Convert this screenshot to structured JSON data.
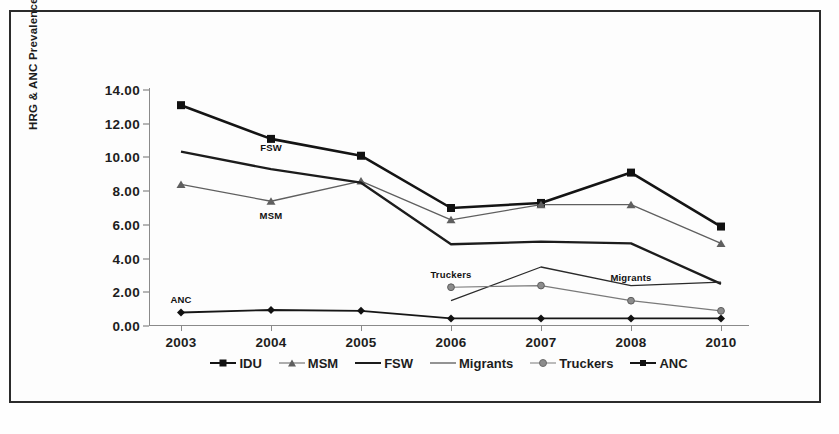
{
  "chart_data": {
    "type": "line",
    "title": "",
    "xlabel": "",
    "ylabel": "HRG & ANC Prevalence (%)",
    "categories": [
      "2003",
      "2004",
      "2005",
      "2006",
      "2007",
      "2008",
      "2010"
    ],
    "ylim": [
      0,
      14
    ],
    "ytick_values": [
      0,
      2,
      4,
      6,
      8,
      10,
      12,
      14
    ],
    "ytick_labels": [
      "0.00",
      "2.00",
      "4.00",
      "6.00",
      "8.00",
      "10.00",
      "12.00",
      "14.00"
    ],
    "grid": false,
    "legend_position": "bottom",
    "series": [
      {
        "name": "IDU",
        "marker": "square",
        "values": [
          13.1,
          11.1,
          10.1,
          7.0,
          7.3,
          9.1,
          5.9
        ]
      },
      {
        "name": "MSM",
        "marker": "triangle",
        "values": [
          8.4,
          7.4,
          8.6,
          6.3,
          7.2,
          7.2,
          4.9
        ]
      },
      {
        "name": "FSW",
        "marker": "none",
        "values": [
          10.35,
          9.3,
          8.5,
          4.85,
          5.0,
          4.9,
          2.5
        ]
      },
      {
        "name": "Migrants",
        "marker": "none",
        "values": [
          null,
          null,
          null,
          1.5,
          3.5,
          2.4,
          2.6
        ]
      },
      {
        "name": "Truckers",
        "marker": "circle",
        "values": [
          null,
          null,
          null,
          2.3,
          2.4,
          1.5,
          0.9
        ]
      },
      {
        "name": "ANC",
        "marker": "diamond",
        "values": [
          0.8,
          0.95,
          0.9,
          0.45,
          0.45,
          0.45,
          0.45
        ]
      }
    ],
    "annotations": [
      {
        "text": "FSW",
        "x_value": "2004",
        "y_value": 10.6
      },
      {
        "text": "MSM",
        "x_value": "2004",
        "y_value": 6.6
      },
      {
        "text": "ANC",
        "x_value": "2003",
        "y_value": 1.6
      },
      {
        "text": "Truckers",
        "x_value": "2006",
        "y_value": 3.1
      },
      {
        "text": "Migrants",
        "x_value": "2008",
        "y_value": 2.9
      }
    ],
    "legend_entries": [
      "IDU",
      "MSM",
      "FSW",
      "Migrants",
      "Truckers",
      "ANC"
    ]
  }
}
